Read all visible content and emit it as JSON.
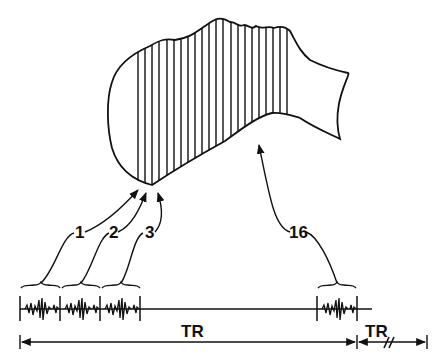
{
  "figure": {
    "type": "schematic",
    "stroke_color": "#111111",
    "background_color": "#ffffff",
    "slice_count_drawn": 18
  },
  "labels": {
    "slice_1": "1",
    "slice_2": "2",
    "slice_3": "3",
    "slice_16": "16",
    "tr_main": "TR",
    "tr_next": "TR"
  },
  "timeline": {
    "blocks": [
      {
        "label": "1",
        "x_start": 20,
        "x_end": 60
      },
      {
        "label": "2",
        "x_start": 60,
        "x_end": 100
      },
      {
        "label": "3",
        "x_start": 100,
        "x_end": 140
      },
      {
        "label": "16",
        "x_start": 317,
        "x_end": 357
      }
    ],
    "break_symbol": "//"
  }
}
